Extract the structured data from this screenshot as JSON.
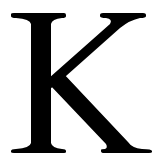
{
  "image": {
    "letter": "K",
    "description": "Serif capital letter K",
    "foreground_color": "#000000",
    "background_color": "#ffffff"
  }
}
